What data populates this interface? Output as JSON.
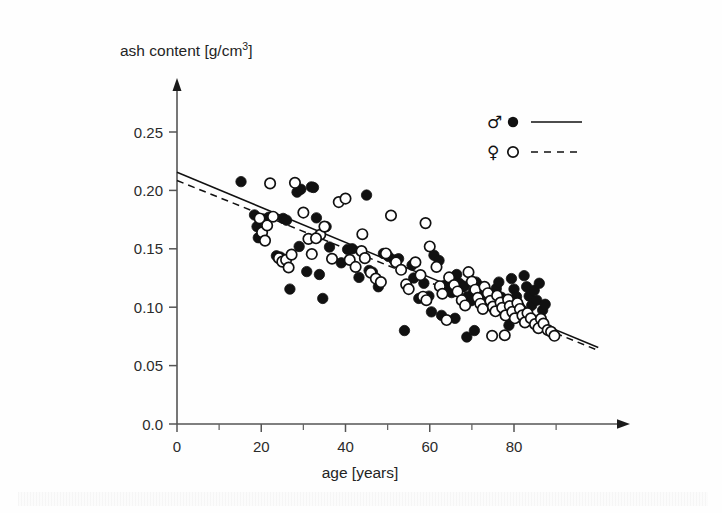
{
  "figure": {
    "background_color": "#fefefe",
    "ink_color": "#111111"
  },
  "chart_data": {
    "type": "scatter",
    "title": "",
    "xlabel": "age [years]",
    "ylabel": "ash content [g/cm3]",
    "ylabel_base": "ash content [g/cm",
    "ylabel_exp": "3",
    "ylabel_tail": "]",
    "xlim": [
      0,
      100
    ],
    "ylim": [
      0.0,
      0.27
    ],
    "grid": false,
    "xticks": [
      0,
      20,
      40,
      60,
      80
    ],
    "xticklabels": [
      "0",
      "20",
      "40",
      "60",
      "80"
    ],
    "xminorticks": [
      10,
      30,
      50,
      70,
      90
    ],
    "yticks": [
      0.0,
      0.05,
      0.1,
      0.15,
      0.2,
      0.25
    ],
    "yticklabels": [
      "0.0",
      "0.05",
      "0.10",
      "0.15",
      "0.20",
      "0.25"
    ],
    "legend": {
      "position": "top-right",
      "entries": [
        {
          "symbol": "♂",
          "name": "male",
          "marker": "filled-circle",
          "line": "solid"
        },
        {
          "symbol": "♀",
          "name": "female",
          "marker": "open-circle",
          "line": "dashed"
        }
      ]
    },
    "series": [
      {
        "name": "male",
        "symbol": "♂",
        "marker": "filled-circle",
        "marker_color": "#111111",
        "line": "solid",
        "fit": {
          "x0": 0,
          "y0": 0.2155,
          "x1": 100,
          "y1": 0.0655
        },
        "points": [
          [
            15.2,
            0.2075
          ],
          [
            18.4,
            0.179
          ],
          [
            19.0,
            0.169
          ],
          [
            19.3,
            0.1595
          ],
          [
            20.5,
            0.1755
          ],
          [
            21.8,
            0.177
          ],
          [
            23.6,
            0.144
          ],
          [
            24.5,
            0.143
          ],
          [
            25.2,
            0.176
          ],
          [
            26.0,
            0.1745
          ],
          [
            26.8,
            0.1155
          ],
          [
            28.5,
            0.1985
          ],
          [
            29.4,
            0.201
          ],
          [
            30.8,
            0.1305
          ],
          [
            31.9,
            0.203
          ],
          [
            32.4,
            0.2025
          ],
          [
            33.1,
            0.1765
          ],
          [
            33.8,
            0.128
          ],
          [
            34.6,
            0.1075
          ],
          [
            35.4,
            0.169
          ],
          [
            36.2,
            0.1515
          ],
          [
            39.0,
            0.138
          ],
          [
            40.5,
            0.1495
          ],
          [
            41.6,
            0.15
          ],
          [
            43.2,
            0.1255
          ],
          [
            45.6,
            0.1315
          ],
          [
            46.4,
            0.13
          ],
          [
            47.8,
            0.1175
          ],
          [
            49.0,
            0.146
          ],
          [
            50.2,
            0.1435
          ],
          [
            51.5,
            0.1405
          ],
          [
            52.6,
            0.1415
          ],
          [
            54.0,
            0.08
          ],
          [
            55.8,
            0.136
          ],
          [
            56.2,
            0.125
          ],
          [
            57.4,
            0.1075
          ],
          [
            58.6,
            0.1205
          ],
          [
            59.8,
            0.1095
          ],
          [
            61.0,
            0.1445
          ],
          [
            62.2,
            0.14
          ],
          [
            63.4,
            0.1185
          ],
          [
            64.0,
            0.1165
          ],
          [
            65.2,
            0.1125
          ],
          [
            66.4,
            0.128
          ],
          [
            67.0,
            0.1205
          ],
          [
            68.2,
            0.118
          ],
          [
            69.0,
            0.109
          ],
          [
            69.8,
            0.1055
          ],
          [
            70.4,
            0.114
          ],
          [
            71.0,
            0.1215
          ],
          [
            71.6,
            0.1185
          ],
          [
            72.2,
            0.1105
          ],
          [
            72.8,
            0.1065
          ],
          [
            73.4,
            0.114
          ],
          [
            74.0,
            0.109
          ],
          [
            74.6,
            0.101
          ],
          [
            75.2,
            0.0985
          ],
          [
            75.8,
            0.116
          ],
          [
            76.4,
            0.1215
          ],
          [
            77.0,
            0.1085
          ],
          [
            77.6,
            0.1035
          ],
          [
            78.2,
            0.0975
          ],
          [
            78.8,
            0.0845
          ],
          [
            79.4,
            0.1245
          ],
          [
            80.0,
            0.1155
          ],
          [
            80.6,
            0.109
          ],
          [
            81.2,
            0.101
          ],
          [
            81.8,
            0.098
          ],
          [
            82.4,
            0.127
          ],
          [
            83.0,
            0.1175
          ],
          [
            83.6,
            0.1095
          ],
          [
            84.2,
            0.1015
          ],
          [
            84.8,
            0.1145
          ],
          [
            85.4,
            0.106
          ],
          [
            86.0,
            0.1205
          ],
          [
            86.8,
            0.0975
          ],
          [
            87.4,
            0.1025
          ],
          [
            68.8,
            0.0745
          ],
          [
            70.6,
            0.08
          ],
          [
            66.0,
            0.0905
          ],
          [
            45.0,
            0.196
          ],
          [
            29.0,
            0.152
          ],
          [
            60.4,
            0.096
          ],
          [
            62.8,
            0.093
          ]
        ]
      },
      {
        "name": "female",
        "symbol": "♀",
        "marker": "open-circle",
        "marker_color": "#ffffff",
        "line": "dashed",
        "fit": {
          "x0": 0,
          "y0": 0.2085,
          "x1": 100,
          "y1": 0.063
        },
        "points": [
          [
            19.6,
            0.176
          ],
          [
            20.2,
            0.164
          ],
          [
            20.9,
            0.157
          ],
          [
            21.4,
            0.17
          ],
          [
            22.1,
            0.206
          ],
          [
            22.8,
            0.1775
          ],
          [
            24.2,
            0.142
          ],
          [
            25.0,
            0.139
          ],
          [
            25.9,
            0.1405
          ],
          [
            27.2,
            0.145
          ],
          [
            28.0,
            0.2065
          ],
          [
            30.0,
            0.181
          ],
          [
            31.2,
            0.1585
          ],
          [
            32.0,
            0.1455
          ],
          [
            34.0,
            0.162
          ],
          [
            36.8,
            0.1415
          ],
          [
            38.4,
            0.19
          ],
          [
            40.0,
            0.193
          ],
          [
            41.0,
            0.1405
          ],
          [
            42.4,
            0.1345
          ],
          [
            43.8,
            0.148
          ],
          [
            44.6,
            0.142
          ],
          [
            46.0,
            0.1295
          ],
          [
            47.2,
            0.1245
          ],
          [
            48.4,
            0.1215
          ],
          [
            49.6,
            0.146
          ],
          [
            50.8,
            0.1785
          ],
          [
            52.0,
            0.1385
          ],
          [
            53.2,
            0.132
          ],
          [
            54.4,
            0.1195
          ],
          [
            55.0,
            0.1155
          ],
          [
            56.6,
            0.1385
          ],
          [
            57.8,
            0.1275
          ],
          [
            58.4,
            0.109
          ],
          [
            59.2,
            0.106
          ],
          [
            60.0,
            0.152
          ],
          [
            61.6,
            0.1345
          ],
          [
            62.4,
            0.118
          ],
          [
            63.0,
            0.1115
          ],
          [
            64.6,
            0.1255
          ],
          [
            65.8,
            0.119
          ],
          [
            66.6,
            0.1135
          ],
          [
            67.6,
            0.106
          ],
          [
            68.4,
            0.1015
          ],
          [
            69.2,
            0.13
          ],
          [
            70.0,
            0.122
          ],
          [
            70.8,
            0.115
          ],
          [
            71.4,
            0.108
          ],
          [
            72.0,
            0.103
          ],
          [
            72.6,
            0.0985
          ],
          [
            73.0,
            0.1175
          ],
          [
            73.8,
            0.112
          ],
          [
            74.4,
            0.1055
          ],
          [
            75.0,
            0.1005
          ],
          [
            75.6,
            0.0965
          ],
          [
            76.0,
            0.11
          ],
          [
            76.8,
            0.104
          ],
          [
            77.2,
            0.0995
          ],
          [
            78.0,
            0.093
          ],
          [
            78.6,
            0.1065
          ],
          [
            79.0,
            0.101
          ],
          [
            79.6,
            0.096
          ],
          [
            80.2,
            0.0905
          ],
          [
            80.8,
            0.1035
          ],
          [
            81.4,
            0.0985
          ],
          [
            82.0,
            0.093
          ],
          [
            82.6,
            0.087
          ],
          [
            83.2,
            0.095
          ],
          [
            84.0,
            0.0905
          ],
          [
            85.0,
            0.0855
          ],
          [
            85.8,
            0.082
          ],
          [
            86.4,
            0.09
          ],
          [
            87.0,
            0.086
          ],
          [
            88.0,
            0.0805
          ],
          [
            88.8,
            0.079
          ],
          [
            89.6,
            0.0755
          ],
          [
            59.0,
            0.172
          ],
          [
            44.0,
            0.1625
          ],
          [
            35.0,
            0.169
          ],
          [
            33.0,
            0.159
          ],
          [
            74.8,
            0.0755
          ],
          [
            77.8,
            0.076
          ],
          [
            64.0,
            0.089
          ],
          [
            26.5,
            0.134
          ]
        ]
      }
    ]
  }
}
